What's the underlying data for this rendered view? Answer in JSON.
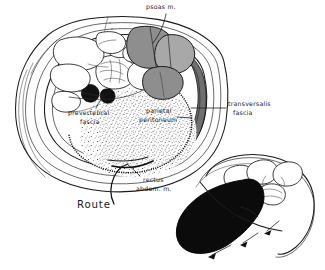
{
  "figure": {
    "background_color": "#ffffff",
    "ink_color": "#1a1a1a"
  },
  "labels": {
    "psoas": "psoas  m.",
    "transversalis_line1": "transversalis",
    "transversalis_line2": "fascia",
    "prevertebral_line1": "prevertebral",
    "prevertebral_line2": "fascia",
    "parietal_line1": "parietal",
    "parietal_line2": "peritoneum",
    "rectus_line1": "rectus",
    "rectus_line2": "abdom.  m.",
    "route": "Route"
  },
  "structures": {
    "main_section": {
      "name": "transverse-abdominal-section",
      "description": "Oval transverse section of the abdomen with layered body wall, vertebral body, bowel loops, great vessels and shaded psoas muscles.",
      "shading": {
        "psoas_muscle_fill": "#8e8e8e",
        "psoas_muscle_fill_light": "#a8a8a8",
        "great_vessel_fill": "#111111",
        "transversalis_band_fill": "#6f6f6f",
        "extravasation_pattern": "stipple"
      }
    },
    "inset_section": {
      "name": "inset-oblique-section",
      "description": "Smaller oblique section at lower right showing a solid black extravasated mass tracking along the flank.",
      "mass_fill": "#0b0b0b",
      "arrow_count": 3,
      "arrow_direction": "down-left"
    }
  },
  "annotations": [
    {
      "id": "psoas",
      "target": "psoas muscle",
      "position": "top-center"
    },
    {
      "id": "transversalis",
      "target": "transversalis fascia",
      "position": "right"
    },
    {
      "id": "prevertebral",
      "target": "prevertebral fascia",
      "position": "left-center"
    },
    {
      "id": "parietal",
      "target": "parietal peritoneum",
      "position": "center"
    },
    {
      "id": "rectus",
      "target": "rectus abdominis muscle",
      "position": "bottom-center"
    },
    {
      "id": "route",
      "target": "route of spread",
      "position": "bottom-left"
    }
  ]
}
